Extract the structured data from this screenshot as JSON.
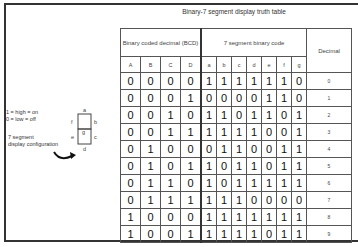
{
  "title": "Binary-7 segment display truth table",
  "legend": {
    "line1": "1 = high = on",
    "line2": "0 = low = off",
    "config_line1": "7 segment",
    "config_line2": "display configuration"
  },
  "segment_diagram": {
    "labels": [
      "a",
      "b",
      "c",
      "d",
      "e",
      "f",
      "g"
    ]
  },
  "table": {
    "group_headers": {
      "bcd": "Binary coded decimal (BCD)",
      "seg": "7 segment binary code",
      "decimal": "Decimal"
    },
    "columns": [
      "A",
      "B",
      "C",
      "D",
      "a",
      "b",
      "c",
      "d",
      "e",
      "f",
      "g"
    ],
    "rows": [
      {
        "bits": [
          "0",
          "0",
          "0",
          "0",
          "1",
          "1",
          "1",
          "1",
          "1",
          "1",
          "0"
        ],
        "dec": "0"
      },
      {
        "bits": [
          "0",
          "0",
          "0",
          "1",
          "0",
          "0",
          "0",
          "0",
          "1",
          "1",
          "0"
        ],
        "dec": "1"
      },
      {
        "bits": [
          "0",
          "0",
          "1",
          "0",
          "1",
          "1",
          "0",
          "1",
          "1",
          "0",
          "1"
        ],
        "dec": "2"
      },
      {
        "bits": [
          "0",
          "0",
          "1",
          "1",
          "1",
          "1",
          "1",
          "1",
          "0",
          "0",
          "1"
        ],
        "dec": "3"
      },
      {
        "bits": [
          "0",
          "1",
          "0",
          "0",
          "0",
          "1",
          "1",
          "0",
          "0",
          "1",
          "1"
        ],
        "dec": "4"
      },
      {
        "bits": [
          "0",
          "1",
          "0",
          "1",
          "1",
          "0",
          "1",
          "1",
          "0",
          "1",
          "1"
        ],
        "dec": "5"
      },
      {
        "bits": [
          "0",
          "1",
          "1",
          "0",
          "1",
          "0",
          "1",
          "1",
          "1",
          "1",
          "1"
        ],
        "dec": "6"
      },
      {
        "bits": [
          "0",
          "1",
          "1",
          "1",
          "1",
          "1",
          "1",
          "0",
          "0",
          "0",
          "0"
        ],
        "dec": "7"
      },
      {
        "bits": [
          "1",
          "0",
          "0",
          "0",
          "1",
          "1",
          "1",
          "1",
          "1",
          "1",
          "1"
        ],
        "dec": "8"
      },
      {
        "bits": [
          "1",
          "0",
          "0",
          "1",
          "1",
          "1",
          "1",
          "1",
          "0",
          "1",
          "1"
        ],
        "dec": "9"
      }
    ]
  }
}
